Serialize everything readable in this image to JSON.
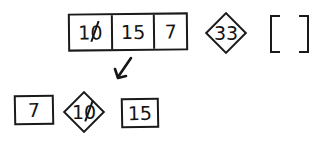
{
  "diagram": {
    "top_row": {
      "array_cells": [
        {
          "value": "10",
          "struck_zero": true
        },
        {
          "value": "15",
          "struck_zero": false
        },
        {
          "value": "7",
          "struck_zero": false
        }
      ],
      "pivot": {
        "value": "33",
        "shape": "diamond"
      },
      "empty_list": {
        "open": "[",
        "close": "]",
        "contents": []
      }
    },
    "arrow": {
      "direction": "down-left",
      "icon": "arrow-down-left-icon"
    },
    "bottom_row": {
      "left": {
        "value": "7",
        "shape": "box"
      },
      "pivot": {
        "value": "10",
        "shape": "diamond",
        "struck_zero": true
      },
      "right": {
        "value": "15",
        "shape": "box"
      }
    },
    "colors": {
      "ink": "#1a1a1a",
      "background": "#ffffff"
    }
  }
}
